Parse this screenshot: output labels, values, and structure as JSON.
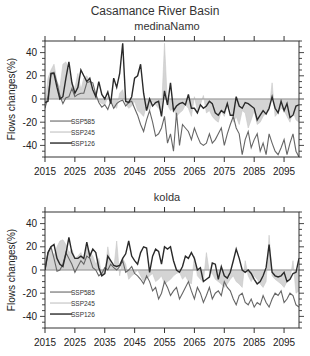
{
  "figure": {
    "title": "Casamance River Basin"
  },
  "chart_data": [
    {
      "type": "line",
      "title": "medinaNamo",
      "xlabel": "",
      "ylabel": "Flows changes(%)",
      "xlim": [
        2015,
        2100
      ],
      "ylim": [
        -50,
        50
      ],
      "xticks": [
        2015,
        2025,
        2035,
        2045,
        2055,
        2065,
        2075,
        2085,
        2095
      ],
      "yticks": [
        -40,
        -20,
        0,
        20,
        40
      ],
      "grid": false,
      "legend": {
        "position": "lower-left",
        "entries": [
          "SSP585",
          "SSP245",
          "SSP126"
        ]
      },
      "x_start": 2015,
      "series": [
        {
          "name": "SSP585",
          "style": "dark-gray-thin-line",
          "color": "#555555",
          "values": [
            -8,
            2,
            22,
            23,
            14,
            3,
            -4,
            1,
            2,
            9,
            2,
            4,
            5,
            5,
            14,
            15,
            14,
            4,
            -3,
            -7,
            -5,
            -9,
            -2,
            -8,
            -4,
            -2,
            -1,
            -6,
            -3,
            -2,
            -8,
            -14,
            -22,
            -28,
            -18,
            -10,
            -20,
            -32,
            -30,
            -25,
            -15,
            -38,
            -30,
            -45,
            -12,
            -40,
            -22,
            -25,
            -28,
            -35,
            -25,
            -32,
            -38,
            -40,
            -38,
            -30,
            -38,
            -35,
            -30,
            -25,
            -40,
            -30,
            -22,
            -15,
            -25,
            -30,
            -48,
            -35,
            -28,
            -42,
            -35,
            -30,
            -45,
            -38,
            -48,
            -30,
            -38,
            -45,
            -48,
            -42,
            -35,
            -48,
            -38,
            -30,
            -45,
            -50
          ]
        },
        {
          "name": "SSP245",
          "style": "light-gray-filled-area",
          "color": "#bbbbbb",
          "values": [
            -5,
            18,
            25,
            30,
            15,
            10,
            30,
            32,
            25,
            12,
            10,
            22,
            8,
            18,
            20,
            15,
            8,
            5,
            -2,
            -4,
            -5,
            2,
            -3,
            -6,
            -8,
            5,
            8,
            -4,
            -8,
            -6,
            -2,
            -10,
            -12,
            -15,
            -5,
            -10,
            -2,
            -5,
            -8,
            -10,
            48,
            -5,
            -10,
            -8,
            -15,
            -12,
            -10,
            -5,
            -8,
            -15,
            2,
            -10,
            -5,
            3,
            -12,
            -10,
            -15,
            -18,
            -20,
            -10,
            -15,
            -5,
            -8,
            -20,
            -15,
            -22,
            -10,
            -12,
            -25,
            -18,
            -10,
            -22,
            -20,
            -15,
            -12,
            -10,
            14,
            -15,
            -12,
            -8,
            -10,
            -15,
            -20,
            -10,
            -18,
            -20
          ]
        },
        {
          "name": "SSP126",
          "style": "black-thick-line",
          "color": "#222222",
          "values": [
            -3,
            -2,
            22,
            22,
            10,
            0,
            2,
            18,
            32,
            14,
            5,
            10,
            25,
            20,
            15,
            18,
            8,
            2,
            15,
            4,
            0,
            6,
            -4,
            18,
            10,
            22,
            48,
            -2,
            -3,
            2,
            18,
            20,
            30,
            5,
            -10,
            0,
            -6,
            -3,
            -2,
            -15,
            7,
            -5,
            14,
            -10,
            -6,
            -4,
            -3,
            -5,
            4,
            -8,
            -8,
            -12,
            -5,
            -8,
            -6,
            -2,
            -4,
            -12,
            -14,
            -10,
            -12,
            -4,
            -14,
            -14,
            2,
            -6,
            -8,
            -3,
            -4,
            -6,
            -8,
            -18,
            -14,
            -10,
            -13,
            -8,
            2,
            -8,
            -12,
            -2,
            -10,
            -4,
            -16,
            -14,
            -6,
            -5
          ]
        }
      ]
    },
    {
      "type": "line",
      "title": "kolda",
      "xlabel": "",
      "ylabel": "Flows changes(%)",
      "xlim": [
        2015,
        2100
      ],
      "ylim": [
        -50,
        50
      ],
      "xticks": [
        2015,
        2025,
        2035,
        2045,
        2055,
        2065,
        2075,
        2085,
        2095
      ],
      "yticks": [
        -40,
        -20,
        0,
        20,
        40
      ],
      "grid": false,
      "legend": {
        "position": "lower-left",
        "entries": [
          "SSP585",
          "SSP245",
          "SSP126"
        ]
      },
      "x_start": 2015,
      "series": [
        {
          "name": "SSP585",
          "style": "dark-gray-thin-line",
          "color": "#555555",
          "values": [
            0,
            15,
            20,
            10,
            -1,
            0,
            5,
            15,
            10,
            5,
            -2,
            3,
            8,
            5,
            12,
            10,
            2,
            0,
            -5,
            -3,
            2,
            0,
            5,
            2,
            0,
            3,
            8,
            -2,
            0,
            3,
            -3,
            -5,
            -8,
            -12,
            -5,
            -10,
            -18,
            -15,
            -25,
            -20,
            -10,
            -15,
            -22,
            -18,
            -15,
            -25,
            -20,
            -15,
            -10,
            -18,
            -25,
            -15,
            -20,
            -28,
            -22,
            -15,
            -25,
            -20,
            -18,
            -22,
            -10,
            -15,
            -18,
            -25,
            -30,
            -22,
            -20,
            -28,
            -30,
            -25,
            -32,
            -28,
            -30,
            -22,
            -28,
            -32,
            -25,
            -20,
            -22,
            -18,
            -28,
            -25,
            -20,
            -22,
            -30,
            -32
          ]
        },
        {
          "name": "SSP245",
          "style": "light-gray-filled-area",
          "color": "#bbbbbb",
          "values": [
            5,
            15,
            18,
            12,
            20,
            25,
            26,
            22,
            15,
            18,
            10,
            12,
            15,
            8,
            20,
            15,
            12,
            5,
            10,
            -5,
            -3,
            20,
            5,
            0,
            25,
            -5,
            10,
            5,
            -8,
            -5,
            -3,
            0,
            -5,
            -10,
            -8,
            -5,
            -3,
            -10,
            -8,
            -5,
            -12,
            -10,
            -8,
            -5,
            -3,
            -2,
            -8,
            -5,
            -10,
            -12,
            12,
            -5,
            -8,
            -10,
            15,
            -2,
            -3,
            -8,
            -10,
            -12,
            -15,
            -12,
            -8,
            -5,
            -10,
            -12,
            -15,
            8,
            -5,
            -10,
            -5,
            -8,
            -12,
            -15,
            -10,
            30,
            -5,
            -8,
            -10,
            -12,
            -15,
            -10,
            -8,
            8,
            -20,
            -18
          ]
        },
        {
          "name": "SSP126",
          "style": "black-thick-line",
          "color": "#222222",
          "values": [
            0,
            15,
            20,
            22,
            10,
            5,
            3,
            14,
            28,
            15,
            10,
            10,
            12,
            10,
            24,
            12,
            18,
            15,
            2,
            -5,
            -3,
            12,
            8,
            4,
            3,
            4,
            10,
            14,
            25,
            12,
            8,
            5,
            15,
            20,
            19,
            -2,
            12,
            18,
            16,
            5,
            20,
            18,
            20,
            8,
            0,
            -2,
            3,
            12,
            10,
            15,
            10,
            0,
            2,
            -10,
            -8,
            -6,
            6,
            5,
            -8,
            3,
            -5,
            -7,
            -2,
            8,
            18,
            10,
            0,
            -2,
            0,
            -3,
            -8,
            -12,
            -10,
            -5,
            2,
            22,
            -2,
            -5,
            -6,
            -5,
            -2,
            -10,
            -8,
            -3,
            -2,
            10,
            -2
          ]
        }
      ]
    }
  ]
}
